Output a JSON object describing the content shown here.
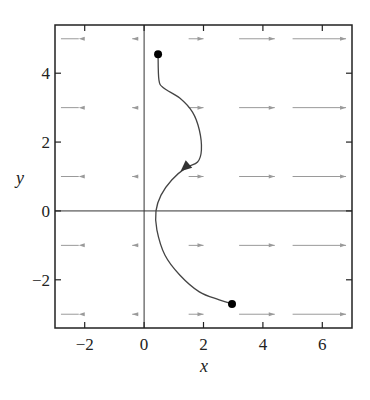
{
  "chart_data": {
    "type": "line",
    "title": "",
    "xlabel": "x",
    "ylabel": "y",
    "xlim": [
      -3,
      7
    ],
    "ylim": [
      -3.4,
      5.4
    ],
    "grid": false,
    "x_ticks": [
      -2,
      0,
      2,
      4,
      6
    ],
    "y_ticks": [
      -2,
      0,
      2,
      4
    ],
    "x_tick_labels": [
      "−2",
      "0",
      "2",
      "4",
      "6"
    ],
    "y_tick_labels": [
      "−2",
      "0",
      "2",
      "4"
    ],
    "axis_lines": {
      "x0": true,
      "y0": true
    },
    "vector_field": {
      "description": "horizontal direction field arrows, length grows with x",
      "rows_y": [
        5,
        3,
        1,
        -1,
        -3
      ],
      "columns": [
        {
          "x_from": -2.8,
          "x_to": -2.2,
          "direction": "left"
        },
        {
          "x_from": -0.2,
          "x_to": -0.4,
          "direction": "left"
        },
        {
          "x_from": 1.5,
          "x_to": 2.0,
          "direction": "right"
        },
        {
          "x_from": 3.2,
          "x_to": 4.4,
          "direction": "right"
        },
        {
          "x_from": 5.0,
          "x_to": 6.8,
          "direction": "right"
        }
      ],
      "color": "#9a9a9a"
    },
    "series": [
      {
        "name": "trajectory",
        "color": "#444444",
        "points": [
          [
            0.47,
            4.55
          ],
          [
            0.5,
            3.8
          ],
          [
            0.66,
            3.57
          ],
          [
            1.2,
            3.28
          ],
          [
            1.63,
            2.87
          ],
          [
            1.86,
            2.35
          ],
          [
            1.93,
            1.77
          ],
          [
            1.8,
            1.42
          ],
          [
            1.4,
            1.25
          ],
          [
            0.93,
            0.9
          ],
          [
            0.57,
            0.46
          ],
          [
            0.4,
            0.0
          ],
          [
            0.43,
            -0.55
          ],
          [
            0.7,
            -1.28
          ],
          [
            1.2,
            -1.86
          ],
          [
            1.86,
            -2.35
          ],
          [
            2.53,
            -2.58
          ],
          [
            2.96,
            -2.7
          ]
        ],
        "markers": [
          {
            "type": "dot",
            "x": 0.47,
            "y": 4.55
          },
          {
            "type": "dot",
            "x": 2.96,
            "y": -2.7
          },
          {
            "type": "arrowhead",
            "x": 1.37,
            "y": 1.26
          }
        ]
      }
    ]
  }
}
